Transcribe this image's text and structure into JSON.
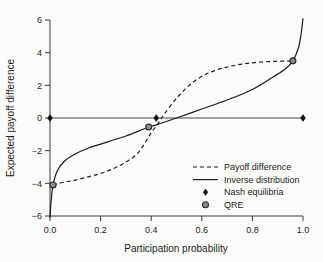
{
  "chart_data": {
    "type": "line",
    "title": "",
    "xlabel": "Participation probability",
    "ylabel": "Expected payoff difference",
    "xlim": [
      0.0,
      1.0
    ],
    "ylim": [
      -6,
      6
    ],
    "grid": false,
    "legend_position": "lower-right",
    "xticks": [
      "0.0",
      "0.2",
      "0.4",
      "0.6",
      "0.8",
      "1.0"
    ],
    "xtick_values": [
      0.0,
      0.2,
      0.4,
      0.6,
      0.8,
      1.0
    ],
    "yticks": [
      "6",
      "4",
      "2",
      "0",
      "−2",
      "−4",
      "−6"
    ],
    "ytick_values": [
      6,
      4,
      2,
      0,
      -2,
      -4,
      -6
    ],
    "reference_line_y": 0,
    "series": [
      {
        "name": "Payoff difference",
        "style": "dashed",
        "color": "#1b1b1b",
        "x": [
          0.012,
          0.05,
          0.1,
          0.15,
          0.2,
          0.25,
          0.3,
          0.35,
          0.4,
          0.42,
          0.45,
          0.5,
          0.55,
          0.6,
          0.65,
          0.7,
          0.75,
          0.8,
          0.85,
          0.9,
          0.95,
          0.96
        ],
        "values": [
          -4.1,
          -3.95,
          -3.8,
          -3.6,
          -3.4,
          -3.1,
          -2.7,
          -2.1,
          -0.9,
          -0.5,
          0.2,
          1.2,
          2.0,
          2.55,
          2.9,
          3.12,
          3.28,
          3.38,
          3.44,
          3.47,
          3.49,
          3.5
        ]
      },
      {
        "name": "Inverse distribution",
        "style": "solid",
        "color": "#1b1b1b",
        "x": [
          0.0,
          0.004,
          0.012,
          0.03,
          0.06,
          0.1,
          0.15,
          0.2,
          0.25,
          0.3,
          0.35,
          0.39,
          0.42,
          0.5,
          0.6,
          0.7,
          0.8,
          0.88,
          0.93,
          0.96,
          0.982,
          0.993,
          1.0
        ],
        "values": [
          -6.1,
          -5.2,
          -4.1,
          -3.2,
          -2.6,
          -2.2,
          -1.85,
          -1.6,
          -1.35,
          -1.1,
          -0.8,
          -0.55,
          -0.42,
          0.0,
          0.55,
          1.1,
          1.75,
          2.5,
          3.0,
          3.5,
          4.3,
          5.2,
          6.1
        ]
      }
    ],
    "points": [
      {
        "label": "Nash equilibria",
        "marker": "diamond",
        "x": 0.0,
        "y": 0.0
      },
      {
        "label": "Nash equilibria",
        "marker": "diamond",
        "x": 0.42,
        "y": 0.0
      },
      {
        "label": "Nash equilibria",
        "marker": "diamond",
        "x": 1.0,
        "y": 0.0
      },
      {
        "label": "QRE",
        "marker": "circle",
        "x": 0.012,
        "y": -4.1
      },
      {
        "label": "QRE",
        "marker": "circle",
        "x": 0.39,
        "y": -0.55
      },
      {
        "label": "QRE",
        "marker": "circle",
        "x": 0.96,
        "y": 3.5
      }
    ],
    "legend": [
      {
        "label": "Payoff difference",
        "marker": "dashed-line"
      },
      {
        "label": "Inverse distribution",
        "marker": "solid-line"
      },
      {
        "label": "Nash equilibria",
        "marker": "diamond"
      },
      {
        "label": "QRE",
        "marker": "circle"
      }
    ]
  }
}
